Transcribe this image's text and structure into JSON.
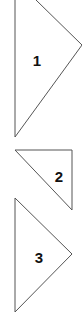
{
  "diagram": {
    "background": "#ffffff",
    "stroke_color": "#555555",
    "shapes": [
      {
        "id": "triangle-1",
        "label": "1",
        "points": [
          [
            15,
            0
          ],
          [
            15,
            137
          ],
          [
            82,
            45
          ]
        ],
        "label_pos": [
          37,
          66
        ]
      },
      {
        "id": "triangle-2",
        "label": "2",
        "points": [
          [
            15,
            150
          ],
          [
            72,
            150
          ],
          [
            72,
            210
          ]
        ],
        "label_pos": [
          59,
          182
        ]
      },
      {
        "id": "triangle-3",
        "label": "3",
        "points": [
          [
            15,
            198
          ],
          [
            72,
            254
          ],
          [
            15,
            312
          ]
        ],
        "label_pos": [
          39,
          263
        ]
      }
    ]
  }
}
